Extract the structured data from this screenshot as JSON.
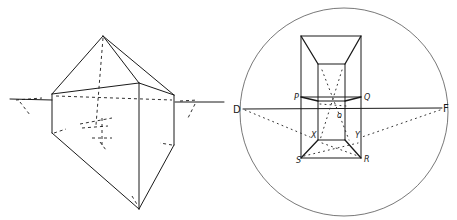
{
  "figure": {
    "left": {
      "title": "perspective-crystal-sketch",
      "description": "Two-point perspective sketch of a prism with pyramidal top and tapered bottom, with dashed hidden construction lines and horizon line"
    },
    "right": {
      "title": "box-in-circle-perspective",
      "labels": {
        "D": "D",
        "F": "F",
        "P": "P",
        "Q": "Q",
        "R": "R",
        "S": "S",
        "X": "X",
        "Y": "Y",
        "O": "o"
      }
    }
  }
}
